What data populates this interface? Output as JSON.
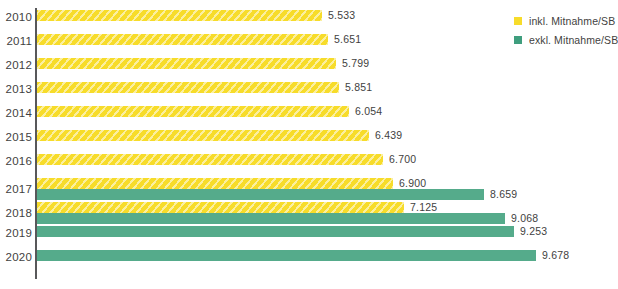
{
  "chart_data": {
    "type": "bar",
    "orientation": "horizontal",
    "title": "",
    "xlabel": "",
    "ylabel": "",
    "categories": [
      "2010",
      "2011",
      "2012",
      "2013",
      "2014",
      "2015",
      "2016",
      "2017",
      "2018",
      "2019",
      "2020"
    ],
    "series": [
      {
        "name": "inkl. Mitnahme/SB",
        "color": "#f7dc2a",
        "hatched": true,
        "values": [
          5533,
          5651,
          5799,
          5851,
          6054,
          6439,
          6700,
          6900,
          7125,
          null,
          null
        ],
        "labels": [
          "5.533",
          "5.651",
          "5.799",
          "5.851",
          "6.054",
          "6.439",
          "6.700",
          "6.900",
          "7.125",
          null,
          null
        ]
      },
      {
        "name": "exkl. Mitnahme/SB",
        "color": "#55ab8b",
        "hatched": false,
        "values": [
          null,
          null,
          null,
          null,
          null,
          null,
          null,
          8659,
          9068,
          9253,
          9678
        ],
        "labels": [
          null,
          null,
          null,
          null,
          null,
          null,
          null,
          "8.659",
          "9.068",
          "9.253",
          "9.678"
        ]
      }
    ],
    "xlim": [
      0,
      10200
    ],
    "grid": false,
    "legend_position": "right-top"
  },
  "legend": {
    "items": [
      {
        "label": "inkl. Mitnahme/SB",
        "swatch": "yellow"
      },
      {
        "label": "exkl. Mitnahme/SB",
        "swatch": "green"
      }
    ]
  }
}
